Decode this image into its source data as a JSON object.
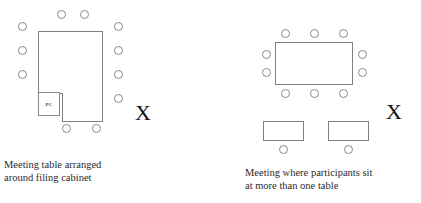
{
  "figure": {
    "background_color": "#ffffff",
    "line_color": "#808080",
    "seat_color": "#8a8a8a",
    "text_color": "#2b2b2b"
  },
  "left_diagram": {
    "caption": "Meeting table arranged\naround filing cabinet",
    "x_marker": "X",
    "pc_cabinet_label": "PC",
    "seat_count_total": 11,
    "seats": {
      "top": 2,
      "left": 3,
      "right": 4,
      "bottom": 2
    }
  },
  "right_diagram": {
    "caption": "Meeting where participants sit\nat more than one table",
    "x_marker": "X",
    "main_table_seats": {
      "top": 3,
      "left": 2,
      "right": 2,
      "bottom": 3
    },
    "secondary_tables": [
      {
        "seats_below": 1
      },
      {
        "seats_below": 1
      }
    ],
    "seat_count_total": 12
  }
}
